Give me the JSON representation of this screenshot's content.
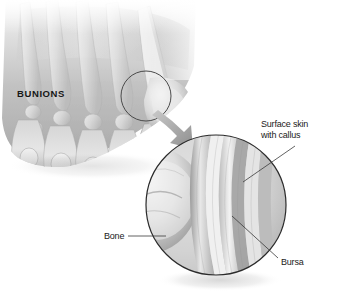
{
  "figure": {
    "background_color": "#ffffff",
    "ink_color": "#1a1a1a",
    "arrow_color": "#9a9a9a"
  },
  "labels": {
    "bunions": "BUNIONS",
    "surface_skin_line1": "Surface skin",
    "surface_skin_line2": "with callus",
    "bone": "Bone",
    "bursa": "Bursa"
  },
  "parts": {
    "foot": "foot-dorsal-view-with-bones",
    "callout_circle": "bunion-highlight-circle",
    "magnifier": "magnified-cross-section-circle",
    "arrow": "zoom-arrow",
    "bone_bump": "metatarsal-head-protrusion",
    "tissue_bands": "bursa-and-skin-layers"
  }
}
